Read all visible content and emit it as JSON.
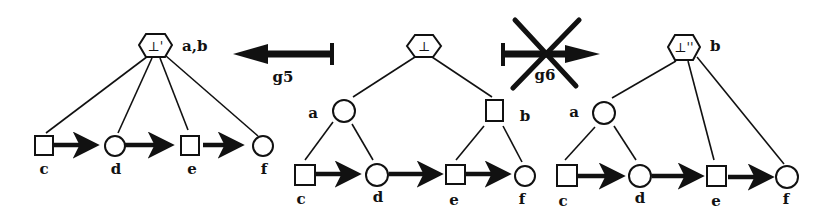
{
  "diagram": {
    "operations": [
      {
        "id": "g5",
        "label": "g5",
        "direction": "left",
        "from": "center",
        "to": "left",
        "blocked": false
      },
      {
        "id": "g6",
        "label": "g6",
        "direction": "right",
        "from": "center",
        "to": "right",
        "blocked": true
      }
    ],
    "panels": {
      "left": {
        "root": {
          "symbol": "⊥'",
          "label": "a,b",
          "shape": "hexagon"
        },
        "leaves": [
          {
            "label": "c",
            "shape": "square"
          },
          {
            "label": "d",
            "shape": "circle"
          },
          {
            "label": "e",
            "shape": "square"
          },
          {
            "label": "f",
            "shape": "circle"
          }
        ]
      },
      "center": {
        "root": {
          "symbol": "⊥",
          "label": "",
          "shape": "hexagon"
        },
        "inner": [
          {
            "label": "a",
            "shape": "circle"
          },
          {
            "label": "b",
            "shape": "square"
          }
        ],
        "leaves": [
          {
            "label": "c",
            "shape": "square"
          },
          {
            "label": "d",
            "shape": "circle"
          },
          {
            "label": "e",
            "shape": "square"
          },
          {
            "label": "f",
            "shape": "circle"
          }
        ]
      },
      "right": {
        "root": {
          "symbol": "⊥''",
          "label": "b",
          "shape": "hexagon"
        },
        "inner": [
          {
            "label": "a",
            "shape": "circle"
          }
        ],
        "leaves": [
          {
            "label": "c",
            "shape": "square"
          },
          {
            "label": "d",
            "shape": "circle"
          },
          {
            "label": "e",
            "shape": "square"
          },
          {
            "label": "f",
            "shape": "circle"
          }
        ]
      }
    }
  }
}
